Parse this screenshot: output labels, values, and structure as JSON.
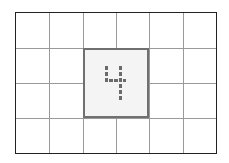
{
  "board": {
    "columns": 6,
    "rows": 4,
    "border_color": "#222222",
    "grid_color": "#999999"
  },
  "highlight": {
    "col_start": 2,
    "col_span": 2,
    "row_start": 1,
    "row_span": 2,
    "value": "4",
    "border_color": "#707070",
    "fill_color": "#f4f4f4",
    "digit_color": "#6a6a6a"
  }
}
